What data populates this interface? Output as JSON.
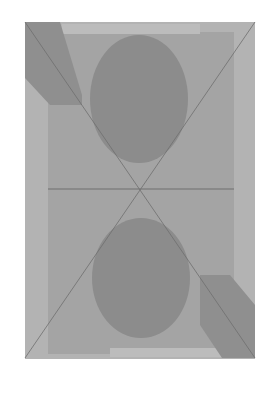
{
  "artwork": {
    "colors": {
      "background": "#ffffff",
      "outer_panel": "#b3b3b3",
      "inner_panel": "#a3a3a3",
      "light_band": "#bdbdbd",
      "circle": "#8c8c8c",
      "diagonal_block": "#8f8f8f",
      "line": "#6e6e6e"
    }
  }
}
